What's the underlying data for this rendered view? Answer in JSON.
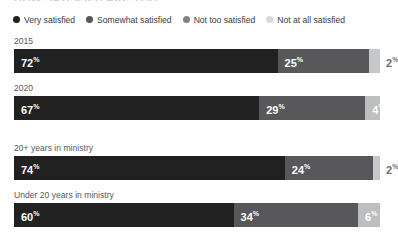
{
  "chart_data": {
    "type": "bar",
    "subtype": "stacked-horizontal-100",
    "title": "HOW SATISFIED ARE YOU",
    "xlabel": "",
    "ylabel": "",
    "xlim": [
      0,
      100
    ],
    "grid": false,
    "legend_position": "top",
    "categories": [
      "2015",
      "2020",
      "20+ years in ministry",
      "Under 20 years in ministry"
    ],
    "series": [
      {
        "name": "Very satisfied",
        "color": "#212121",
        "values": [
          72,
          67,
          74,
          60
        ]
      },
      {
        "name": "Somewhat satisfied",
        "color": "#58585a",
        "values": [
          25,
          29,
          24,
          34
        ]
      },
      {
        "name": "Not too satisfied",
        "color": "#a7a9ac",
        "values": [
          2,
          4,
          2,
          6
        ]
      },
      {
        "name": "Not at all satisfied",
        "color": "#d8d9da",
        "values": [
          0,
          0,
          0,
          0
        ]
      }
    ]
  },
  "legend": {
    "items": [
      {
        "label": "Very satisfied",
        "color": "#212121"
      },
      {
        "label": "Somewhat satisfied",
        "color": "#58585a"
      },
      {
        "label": "Not too satisfied",
        "color": "#808285"
      },
      {
        "label": "Not at all satisfied",
        "color": "#d8d9da"
      }
    ]
  },
  "groups": [
    {
      "rows": [
        {
          "label": "2015",
          "segments": [
            {
              "value": "72",
              "pct": "%",
              "width": 72,
              "color": "#212121",
              "label_placement": "inside-dark"
            },
            {
              "value": "25",
              "pct": "%",
              "width": 25,
              "color": "#58585a",
              "label_placement": "inside-dark"
            },
            {
              "value": "2",
              "pct": "%",
              "width": 3,
              "color": "#c7c8ca",
              "label_placement": "outside"
            }
          ]
        },
        {
          "label": "2020",
          "segments": [
            {
              "value": "67",
              "pct": "%",
              "width": 67,
              "color": "#212121",
              "label_placement": "inside-dark"
            },
            {
              "value": "29",
              "pct": "%",
              "width": 29,
              "color": "#58585a",
              "label_placement": "inside-dark"
            },
            {
              "value": "4",
              "pct": "%",
              "width": 4,
              "color": "#bcbec0",
              "label_placement": "inside-light"
            }
          ]
        }
      ]
    },
    {
      "rows": [
        {
          "label": "20+ years in ministry",
          "segments": [
            {
              "value": "74",
              "pct": "%",
              "width": 74,
              "color": "#212121",
              "label_placement": "inside-dark"
            },
            {
              "value": "24",
              "pct": "%",
              "width": 24,
              "color": "#58585a",
              "label_placement": "inside-dark"
            },
            {
              "value": "2",
              "pct": "%",
              "width": 2,
              "color": "#c7c8ca",
              "label_placement": "outside"
            }
          ]
        },
        {
          "label": "Under 20 years in ministry",
          "segments": [
            {
              "value": "60",
              "pct": "%",
              "width": 60,
              "color": "#212121",
              "label_placement": "inside-dark"
            },
            {
              "value": "34",
              "pct": "%",
              "width": 34,
              "color": "#58585a",
              "label_placement": "inside-dark"
            },
            {
              "value": "6",
              "pct": "%",
              "width": 6,
              "color": "#bcbec0",
              "label_placement": "inside-light"
            }
          ]
        }
      ]
    }
  ]
}
